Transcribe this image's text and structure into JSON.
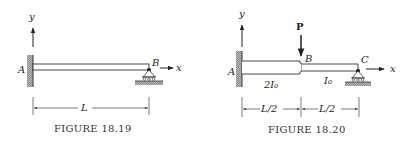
{
  "figure1": {
    "caption": "Figure 18.19",
    "caption_display": "FIGURE 18.19",
    "axis_y": "y",
    "axis_x": "x",
    "point_a": "A",
    "point_b": "B",
    "length": "L"
  },
  "figure2": {
    "caption": "Figure 18.20",
    "caption_display": "FIGURE 18.20",
    "axis_y": "y",
    "axis_x": "x",
    "point_a": "A",
    "point_b": "B",
    "point_c": "C",
    "load": "P",
    "inertia_left": "2I₀",
    "inertia_right": "I₀",
    "length_left": "L/2",
    "length_right": "L/2"
  },
  "colors": {
    "line": "#333333",
    "hatch": "#888888"
  }
}
